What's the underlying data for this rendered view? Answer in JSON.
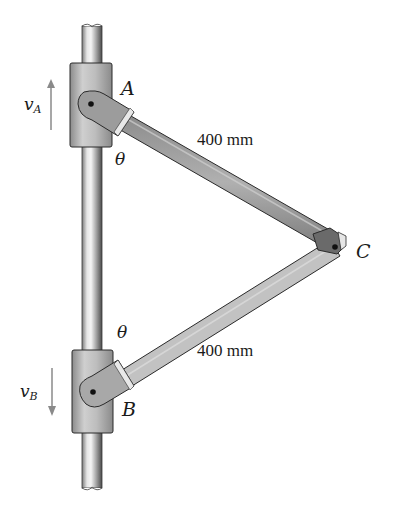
{
  "figure": {
    "points": {
      "A": {
        "label": "A"
      },
      "B": {
        "label": "B"
      },
      "C": {
        "label": "C"
      }
    },
    "angles": {
      "theta_top": "θ",
      "theta_bottom": "θ"
    },
    "velocities": {
      "vA": {
        "symbol": "v",
        "subscript": "A",
        "direction": "up"
      },
      "vB": {
        "symbol": "v",
        "subscript": "B",
        "direction": "down"
      }
    },
    "dimensions": {
      "link_AC": "400 mm",
      "link_BC": "400 mm"
    },
    "colors": {
      "rod_light": "#e0e0e0",
      "rod_dark": "#6e6e6e",
      "collar": "#b9b9b9",
      "link": "#9a9a9a",
      "link_light": "#c4c4c4",
      "arrow": "#8a8a8a",
      "outline": "#2a2a2a"
    }
  }
}
